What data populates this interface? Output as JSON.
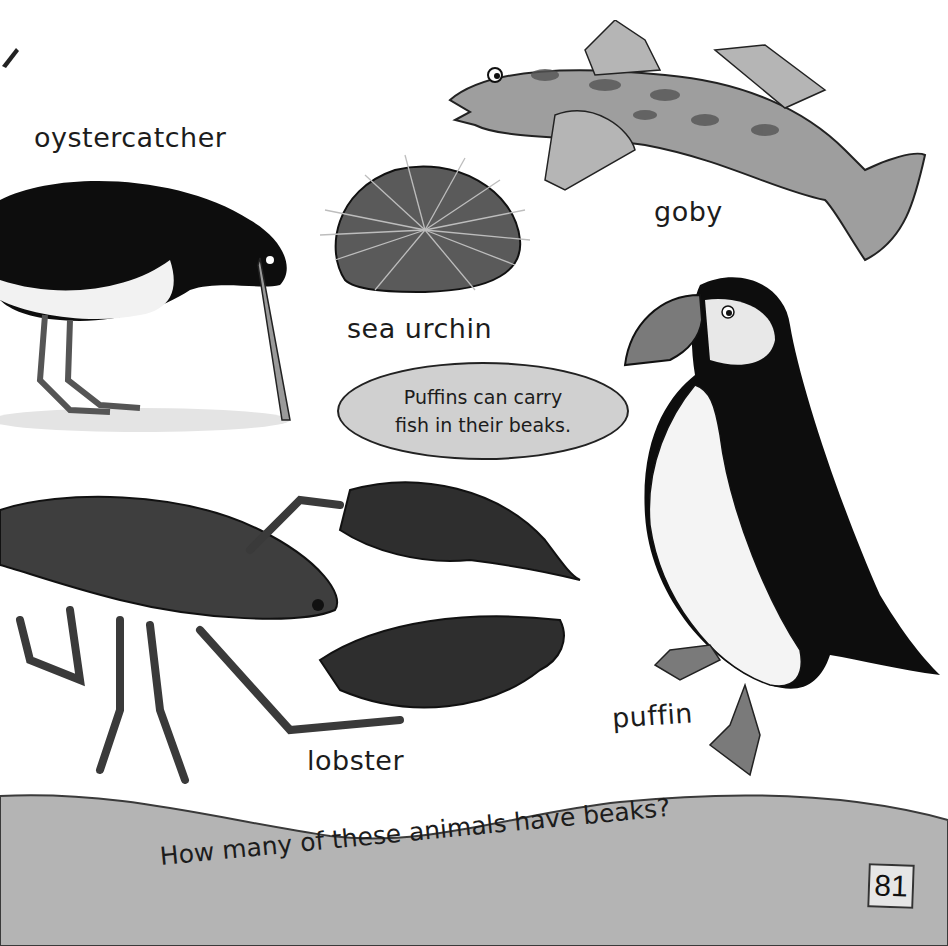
{
  "page": {
    "page_number": "81",
    "question": "How many of these animals have beaks?",
    "fact_bubble": {
      "line1": "Puffins can carry",
      "line2": "fish in their beaks."
    },
    "animals": [
      {
        "label": "oystercatcher",
        "has_beak": true
      },
      {
        "label": "sea urchin",
        "has_beak": false
      },
      {
        "label": "goby",
        "has_beak": false
      },
      {
        "label": "puffin",
        "has_beak": true
      },
      {
        "label": "lobster",
        "has_beak": false
      }
    ],
    "colors": {
      "background": "#ffffff",
      "footer_band": "#b4b4b4",
      "bubble_fill": "#d0d0d0",
      "page_box": "#e6e6e6"
    }
  }
}
